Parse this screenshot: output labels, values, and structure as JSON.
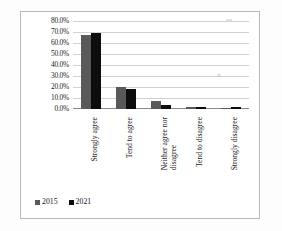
{
  "chart_data": {
    "type": "bar",
    "title": "",
    "xlabel": "",
    "ylabel": "",
    "ylim": [
      0,
      0.8
    ],
    "grid": true,
    "legend_position": "bottom-left",
    "categories": [
      "Strongly agree",
      "Tend to agree",
      "Neither agree nor disagree",
      "Tend to disagree",
      "Strongly disagree"
    ],
    "category_lines": [
      [
        "Strongly agree"
      ],
      [
        "Tend to agree"
      ],
      [
        "Neither agree nor",
        "disagree"
      ],
      [
        "Tend to disagree"
      ],
      [
        "Strongly disagree"
      ]
    ],
    "ytick_labels": [
      "0.0%",
      "10.0%",
      "20.0%",
      "30.0%",
      "40.0%",
      "50.0%",
      "60.0%",
      "70.0%",
      "80.0%"
    ],
    "ytick_values": [
      0,
      10,
      20,
      30,
      40,
      50,
      60,
      70,
      80
    ],
    "series": [
      {
        "name": "2015",
        "color": "#595959",
        "values": [
          67.0,
          20.0,
          7.5,
          2.0,
          1.0
        ],
        "value_labels": [
          "67.0%",
          "20.0%",
          "7.5%",
          "2.0%",
          "1.0%"
        ]
      },
      {
        "name": "2021",
        "color": "#0d0d0d",
        "values": [
          69.5,
          18.5,
          3.5,
          1.5,
          1.8
        ],
        "value_labels": [
          "69.5%",
          "18.5%",
          "3.5%",
          "1.5%",
          "1.8%"
        ]
      }
    ]
  },
  "legend": {
    "items": [
      {
        "label": "2015",
        "color": "#595959"
      },
      {
        "label": "2021",
        "color": "#0d0d0d"
      }
    ]
  }
}
